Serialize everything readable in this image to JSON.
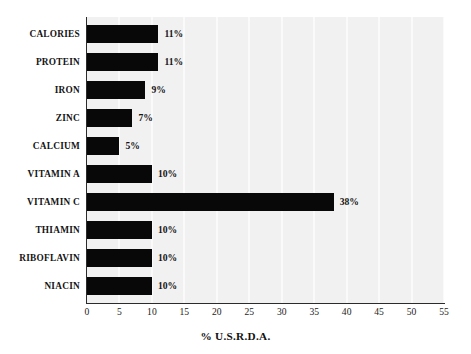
{
  "chart_data": {
    "type": "bar",
    "orientation": "horizontal",
    "title": "",
    "xlabel": "% U.S.R.D.A.",
    "ylabel": "",
    "xlim": [
      0,
      55
    ],
    "ylim": null,
    "grid": true,
    "legend": null,
    "xticks": [
      "0",
      "5",
      "10",
      "15",
      "20",
      "25",
      "30",
      "35",
      "40",
      "45",
      "50",
      "55"
    ],
    "categories": [
      "CALORIES",
      "PROTEIN",
      "IRON",
      "ZINC",
      "CALCIUM",
      "VITAMIN A",
      "VITAMIN C",
      "THIAMIN",
      "RIBOFLAVIN",
      "NIACIN"
    ],
    "values": [
      11,
      11,
      9,
      7,
      5,
      10,
      38,
      10,
      10,
      10
    ],
    "data_labels": [
      "11%",
      "11%",
      "9%",
      "7%",
      "5%",
      "10%",
      "38%",
      "10%",
      "10%",
      "10%"
    ],
    "bar_color": "#080808",
    "plot_background": "#f1f1f1",
    "page_background": "#ffffff",
    "axis_color": "#2b2b2b"
  }
}
